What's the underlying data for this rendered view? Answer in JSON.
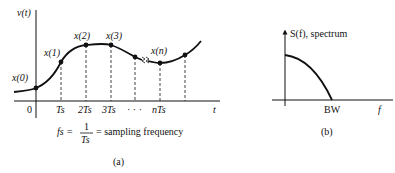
{
  "panel_a": {
    "y_axis_label": "v(t)",
    "x_axis_label": "t",
    "sample_labels": [
      "x(0)",
      "x(1)",
      "x(2)",
      "x(3)",
      "x(n)"
    ],
    "tick_labels": [
      "0",
      "Ts",
      "2Ts",
      "3Ts",
      "· · ·",
      "nTs"
    ],
    "formula_lhs": "fs =",
    "formula_num": "1",
    "formula_den": "Ts",
    "formula_rhs": "= sampling frequency",
    "caption": "(a)"
  },
  "panel_b": {
    "y_axis_label": "S(f), spectrum",
    "x_axis_label": "f",
    "tick_label": "BW",
    "caption": "(b)"
  },
  "colors": {
    "ink": "#111111",
    "background": "#ffffff"
  }
}
